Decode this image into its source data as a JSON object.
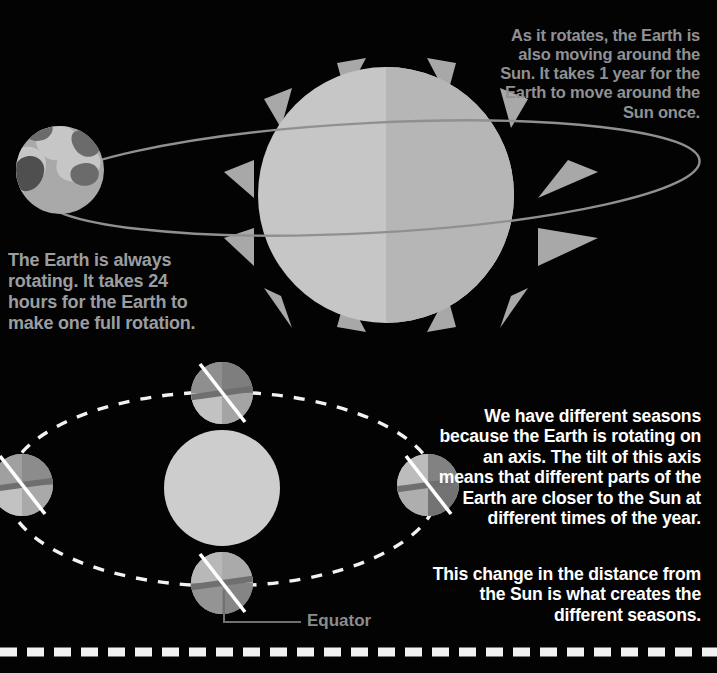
{
  "canvas": {
    "width": 717,
    "height": 673,
    "background": "#030303"
  },
  "palette": {
    "sun_light": "#c9c9c9",
    "sun_dark": "#b4b4b4",
    "sun_lower": "#cfcfcf",
    "ray": "#a8a8a8",
    "orbit_ring": "#8e9093",
    "orbit_dashed": "#f2f2f2",
    "earth_light": "#c2c2c2",
    "earth_mid": "#a9a9a9",
    "earth_dark": "#8f8f8f",
    "earth_darker": "#7a7a7a",
    "continent_dark": "#6b6b6b",
    "continent_darkest": "#4f4f4f",
    "axis_line": "#ffffff",
    "text_gray": "#8f9194",
    "text_gray_bright": "#9b9da0",
    "text_white": "#ffffff",
    "label_gray": "#8a8c8f",
    "leader_gray": "#6f7174"
  },
  "annotations": {
    "rotates_text": "As it rotates, the Earth is also moving around the Sun. It takes 1 year for the Earth to move around the Sun once.",
    "earth_rotating_text": "The Earth is always rotating. It takes 24 hours for the Earth to make one full rotation.",
    "seasons_text": "We have different seasons because the Earth is rotating on an axis. The tilt of this axis means that different parts of the Earth are closer to the Sun at different times of the year.",
    "distance_text": "This change in the distance from the Sun is what creates the different seasons.",
    "equator_label": "Equator"
  },
  "top_diagram": {
    "name": "earth-orbiting-sun",
    "sun": {
      "cx": 386,
      "cy": 195,
      "r": 128,
      "rays": 12
    },
    "orbit_ring": {
      "cx": 370,
      "cy": 178,
      "rx": 330,
      "ry": 55,
      "rotation_deg": -3
    },
    "earth": {
      "cx": 60,
      "cy": 170,
      "r": 44
    }
  },
  "bottom_diagram": {
    "name": "seasons-orbit",
    "sun": {
      "cx": 222,
      "cy": 488,
      "r": 58
    },
    "orbit": {
      "cx": 222,
      "cy": 489,
      "rx": 216,
      "ry": 97,
      "style": "dashed"
    },
    "earths": [
      {
        "position": "top",
        "cx": 222,
        "cy": 393,
        "r": 31
      },
      {
        "position": "left",
        "cx": 22,
        "cy": 485,
        "r": 31
      },
      {
        "position": "right",
        "cx": 428,
        "cy": 485,
        "r": 31
      },
      {
        "position": "bottom",
        "cx": 222,
        "cy": 583,
        "r": 31
      }
    ],
    "axis_tilt_deg": 23.5
  },
  "bottom_border": {
    "style": "dashed",
    "color": "#f2f2f2",
    "y": 652
  }
}
